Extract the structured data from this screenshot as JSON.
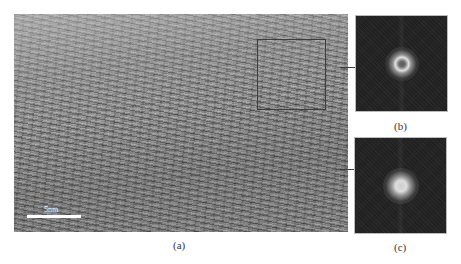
{
  "figure": {
    "panels": [
      {
        "id": "a",
        "label": "(a)",
        "type": "HRTEM micrograph",
        "scale_bar": {
          "label": "5nm"
        },
        "region_of_interest": true
      },
      {
        "id": "b",
        "label": "(b)",
        "type": "FFT pattern",
        "linked_to": "region-of-interest box"
      },
      {
        "id": "c",
        "label": "(c)",
        "type": "FFT pattern",
        "linked_to": "lower region of micrograph"
      }
    ],
    "colors": {
      "background": "#ffffff",
      "micrograph_gray": "#8a8a8a",
      "fft_background": "#252525",
      "annotation_line": "#3c3c3c",
      "scale_bar": "#ffffff"
    }
  }
}
